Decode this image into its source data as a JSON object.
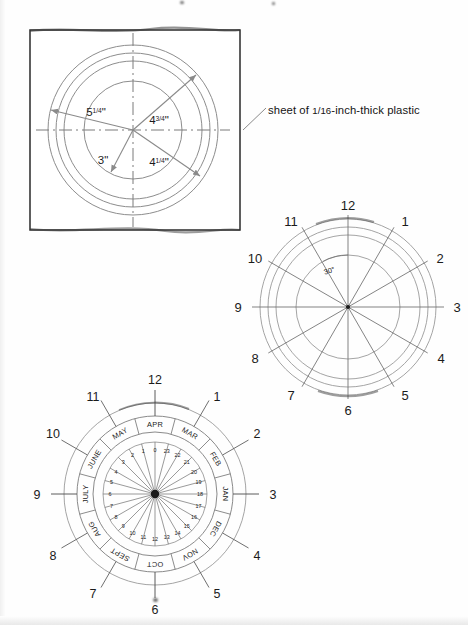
{
  "document": {
    "type": "technical-drawing",
    "description": "Sundial / time-and-month dial construction drawing on plastic sheet"
  },
  "figure_material": {
    "id": "fig-plastic-sheet",
    "callout_text_before": "sheet of ",
    "callout_fraction": "1/16",
    "callout_text_after": "-inch-thick plastic",
    "callout_full": "sheet of 1/16-inch-thick plastic",
    "dimensions": [
      {
        "name": "outer-ring-diameter",
        "value": "5",
        "fraction": "1/4",
        "unit": "\"",
        "label": "5¼\""
      },
      {
        "name": "second-ring-diameter",
        "value": "4",
        "fraction": "3/4",
        "unit": "\"",
        "label": "4¾\""
      },
      {
        "name": "third-ring-diameter",
        "value": "4",
        "fraction": "1/4",
        "unit": "\"",
        "label": "4¼\""
      },
      {
        "name": "inner-ring-diameter",
        "value": "3",
        "fraction": "",
        "unit": "\"",
        "label": "3\""
      }
    ],
    "ring_count": 4
  },
  "figure_hours": {
    "id": "fig-hour-dial",
    "angle_label": "30°",
    "ring_count": 4,
    "hour_marks": [
      "1",
      "2",
      "3",
      "4",
      "5",
      "6",
      "7",
      "8",
      "9",
      "10",
      "11",
      "12"
    ]
  },
  "figure_calendar": {
    "id": "fig-calendar-dial",
    "hour_marks": [
      "1",
      "2",
      "3",
      "4",
      "5",
      "6",
      "7",
      "8",
      "9",
      "10",
      "11",
      "12"
    ],
    "months": [
      "MAR",
      "FEB",
      "JAN",
      "DEC",
      "NOV",
      "OCT",
      "SEPT",
      "AUG",
      "JULY",
      "JUNE",
      "MAY",
      "APR"
    ],
    "inner_numbers": [
      "0",
      "1",
      "2",
      "3",
      "4",
      "5",
      "6",
      "7",
      "8",
      "9",
      "10",
      "11",
      "12",
      "13",
      "14",
      "15",
      "16",
      "17",
      "18",
      "19",
      "20",
      "21",
      "22",
      "23"
    ],
    "spoke_count": 24,
    "ring_count": 3
  },
  "colors": {
    "ink": "#1b1b1b",
    "line": "#6e6e6e",
    "line_light": "#8d8d8d",
    "dim_arrow": "#808080",
    "paper": "#fefefe"
  }
}
